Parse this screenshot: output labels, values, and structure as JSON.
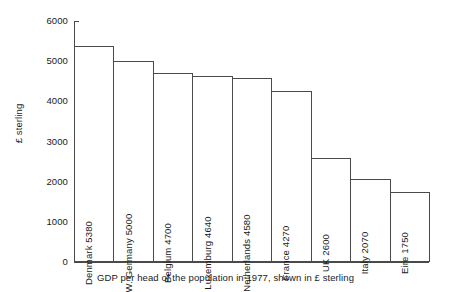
{
  "chart_data": {
    "type": "bar",
    "title": "",
    "caption": "GDP per head of the population in 1977, shown in £ sterling",
    "xlabel": "",
    "ylabel": "£ sterling",
    "ylim": [
      0,
      6000
    ],
    "ytick_step": 1000,
    "yticks": [
      "0",
      "1000",
      "2000",
      "3000",
      "4000",
      "5000",
      "6000"
    ],
    "grid": false,
    "legend": false,
    "bar_gap": 0,
    "bar_fill": "#ffffff",
    "bar_stroke": "#4a4a4a",
    "categories": [
      "Denmark",
      "W. Germany",
      "Belgium",
      "Luxemburg",
      "Netherlands",
      "France",
      "UK",
      "Italy",
      "Eire"
    ],
    "values": [
      5380,
      5000,
      4700,
      4640,
      4580,
      4270,
      2600,
      2070,
      1750
    ],
    "bar_labels": [
      "Denmark 5380",
      "W. Germany 5000",
      "Belgium 4700",
      "Luxemburg 4640",
      "Netherlands 4580",
      "France 4270",
      "UK 2600",
      "Italy 2070",
      "Eire 1750"
    ]
  }
}
